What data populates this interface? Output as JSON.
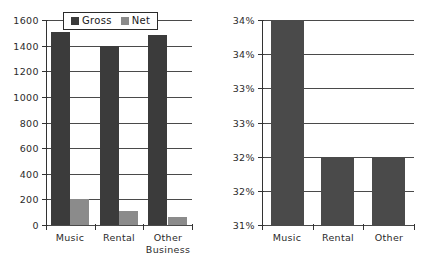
{
  "figure": {
    "background": "#ffffff",
    "colors": {
      "gross": "#3b3b3b",
      "net": "#8b8b8b",
      "solo_bar": "#4a4a4a",
      "axis": "#333333",
      "gridline": "#4a4a4a"
    }
  },
  "legend": {
    "items": [
      {
        "label": "Gross",
        "color": "#3b3b3b",
        "swatch": "legend-swatch-gross"
      },
      {
        "label": "Net",
        "color": "#8b8b8b",
        "swatch": "legend-swatch-net"
      }
    ]
  },
  "chart_data": [
    {
      "id": "left-chart",
      "type": "bar",
      "title": "",
      "xlabel": "",
      "ylabel": "",
      "categories": [
        "Music",
        "Rental",
        "Other Business"
      ],
      "series": [
        {
          "name": "Gross",
          "color": "#3b3b3b",
          "values": [
            1510,
            1400,
            1485
          ]
        },
        {
          "name": "Net",
          "color": "#8b8b8b",
          "values": [
            200,
            110,
            65
          ]
        }
      ],
      "ylim": [
        0,
        1600
      ],
      "yticks": [
        0,
        200,
        400,
        600,
        800,
        1000,
        1200,
        1400,
        1600
      ],
      "ytick_labels": [
        "0",
        "200",
        "400",
        "600",
        "800",
        "1000",
        "1200",
        "1400",
        "1600"
      ],
      "grid": true,
      "legend_position": "top-center"
    },
    {
      "id": "right-chart",
      "type": "bar",
      "title": "",
      "xlabel": "",
      "ylabel": "",
      "categories": [
        "Music",
        "Rental",
        "Other"
      ],
      "series": [
        {
          "name": "Margin",
          "color": "#4a4a4a",
          "values": [
            34.0,
            32.0,
            32.0
          ]
        }
      ],
      "ylim": [
        31.0,
        34.0
      ],
      "yticks": [
        31.0,
        31.5,
        32.0,
        32.5,
        33.0,
        33.5,
        34.0
      ],
      "ytick_labels": [
        "31%",
        "32%",
        "32%",
        "33%",
        "33%",
        "34%",
        "34%"
      ],
      "grid": true,
      "legend_position": "none"
    }
  ]
}
